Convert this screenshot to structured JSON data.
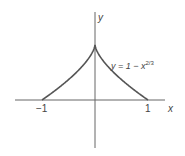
{
  "chart_data": {
    "type": "line",
    "title": "",
    "xlabel": "x",
    "ylabel": "y",
    "x_ticks": [
      "-1",
      "1"
    ],
    "x_tick_values": [
      -1,
      1
    ],
    "grid": false,
    "legend": null,
    "series": [
      {
        "name": "y = 1 − x^(2/3)",
        "function": "y = 1 - x^(2/3)",
        "x": [
          -1,
          -0.8,
          -0.6,
          -0.4,
          -0.2,
          -0.05,
          0,
          0.05,
          0.2,
          0.4,
          0.6,
          0.8,
          1
        ],
        "y": [
          0,
          0.138,
          0.289,
          0.457,
          0.658,
          0.864,
          1,
          0.864,
          0.658,
          0.457,
          0.289,
          0.138,
          0
        ]
      }
    ],
    "annotations": [
      {
        "text": "y = 1 − x^{2/3}",
        "position": "right of curve, upper"
      }
    ],
    "xlim": [
      -1.5,
      1.3
    ],
    "ylim": [
      -0.9,
      1.6
    ]
  },
  "labels": {
    "y_axis": "y",
    "x_axis": "x",
    "tick_neg1": "−1",
    "tick_pos1": "1",
    "eq_main": "y = 1 − x",
    "eq_exp": "2/3"
  },
  "colors": {
    "axis": "#555555",
    "curve": "#555555",
    "text": "#444444"
  }
}
